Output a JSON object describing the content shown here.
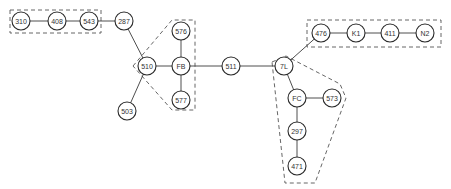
{
  "diagram": {
    "type": "network-graph",
    "node_radius": 9,
    "colors": {
      "stroke": "#2a2a2a",
      "background": "#ffffff",
      "group_stroke": "#555555"
    },
    "nodes": [
      {
        "id": "310",
        "label": "310",
        "x": 21,
        "y": 21
      },
      {
        "id": "408",
        "label": "408",
        "x": 57,
        "y": 21
      },
      {
        "id": "543",
        "label": "543",
        "x": 89,
        "y": 21
      },
      {
        "id": "287",
        "label": "287",
        "x": 124,
        "y": 21
      },
      {
        "id": "510",
        "label": "510",
        "x": 147,
        "y": 66
      },
      {
        "id": "503",
        "label": "503",
        "x": 127,
        "y": 111
      },
      {
        "id": "FB",
        "label": "FB",
        "x": 181,
        "y": 66
      },
      {
        "id": "576",
        "label": "576",
        "x": 181,
        "y": 31
      },
      {
        "id": "577",
        "label": "577",
        "x": 181,
        "y": 100
      },
      {
        "id": "511",
        "label": "511",
        "x": 231,
        "y": 66
      },
      {
        "id": "7L",
        "label": "7L",
        "x": 284,
        "y": 66
      },
      {
        "id": "476",
        "label": "476",
        "x": 321,
        "y": 33
      },
      {
        "id": "K1",
        "label": "K1",
        "x": 356,
        "y": 33
      },
      {
        "id": "411",
        "label": "411",
        "x": 390,
        "y": 33
      },
      {
        "id": "N2",
        "label": "N2",
        "x": 425,
        "y": 33
      },
      {
        "id": "FC",
        "label": "FC",
        "x": 297,
        "y": 98
      },
      {
        "id": "573",
        "label": "573",
        "x": 332,
        "y": 98
      },
      {
        "id": "297",
        "label": "297",
        "x": 297,
        "y": 131
      },
      {
        "id": "471",
        "label": "471",
        "x": 297,
        "y": 166
      }
    ],
    "edges": [
      [
        "310",
        "408"
      ],
      [
        "408",
        "543"
      ],
      [
        "543",
        "287"
      ],
      [
        "287",
        "510"
      ],
      [
        "510",
        "503"
      ],
      [
        "510",
        "FB"
      ],
      [
        "FB",
        "576"
      ],
      [
        "FB",
        "577"
      ],
      [
        "FB",
        "511"
      ],
      [
        "511",
        "7L"
      ],
      [
        "7L",
        "476"
      ],
      [
        "476",
        "K1"
      ],
      [
        "K1",
        "411"
      ],
      [
        "411",
        "N2"
      ],
      [
        "7L",
        "FC"
      ],
      [
        "FC",
        "573"
      ],
      [
        "FC",
        "297"
      ],
      [
        "297",
        "471"
      ]
    ],
    "groups": [
      {
        "id": "group-left-chain",
        "members": [
          "310",
          "408",
          "543"
        ],
        "shape": "rect",
        "points": [
          [
            10,
            10
          ],
          [
            101,
            10
          ],
          [
            101,
            33
          ],
          [
            10,
            33
          ]
        ]
      },
      {
        "id": "group-fb-cluster",
        "members": [
          "510",
          "FB",
          "576",
          "577"
        ],
        "shape": "polygon",
        "points": [
          [
            133,
            66
          ],
          [
            172,
            20
          ],
          [
            195,
            20
          ],
          [
            195,
            110
          ],
          [
            172,
            110
          ]
        ]
      },
      {
        "id": "group-right-chain",
        "members": [
          "476",
          "K1",
          "411",
          "N2"
        ],
        "shape": "rect",
        "points": [
          [
            307,
            20
          ],
          [
            441,
            20
          ],
          [
            441,
            47
          ],
          [
            307,
            47
          ]
        ]
      },
      {
        "id": "group-fc-cluster",
        "members": [
          "7L",
          "FC",
          "573",
          "297",
          "471"
        ],
        "shape": "polygon",
        "points": [
          [
            272,
            62
          ],
          [
            286,
            56
          ],
          [
            340,
            84
          ],
          [
            346,
            98
          ],
          [
            315,
            183
          ],
          [
            285,
            183
          ]
        ]
      }
    ]
  }
}
